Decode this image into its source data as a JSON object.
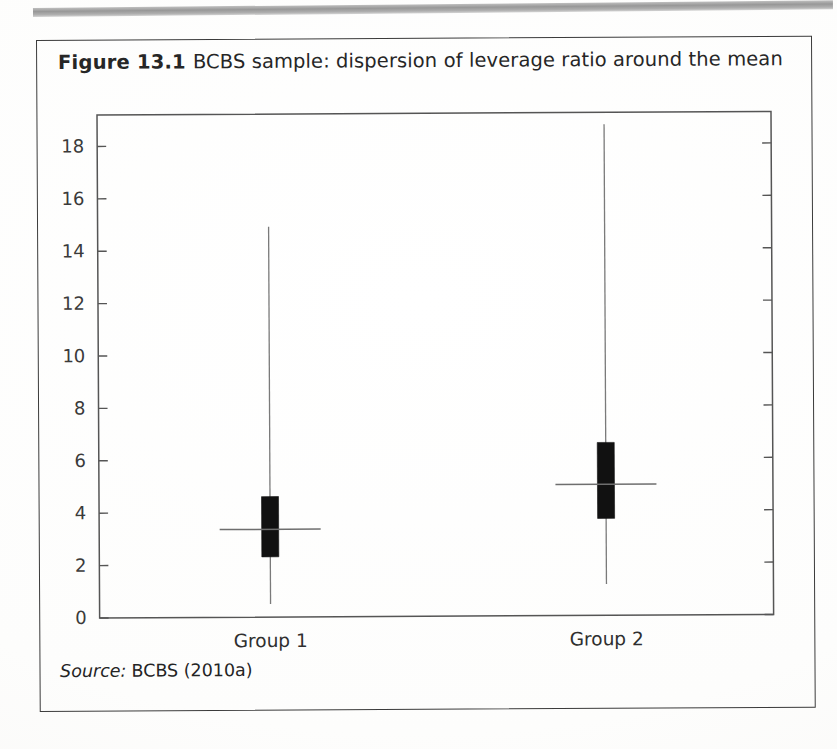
{
  "figure": {
    "caption_number": "Figure 13.1",
    "caption_text": "BCBS sample: dispersion of leverage ratio around the mean",
    "source_label": "Source:",
    "source_value": "BCBS (2010a)"
  },
  "colors": {
    "box_fill": "#111111",
    "whisker": "#7a7a7a",
    "mean_line": "#6e6e6e",
    "axis": "#555555",
    "frame": "#3b3b3b",
    "text": "#262626",
    "page": "#ffffff"
  },
  "chart_data": {
    "type": "box",
    "title": "BCBS sample: dispersion of leverage ratio around the mean",
    "xlabel": "",
    "ylabel": "",
    "ylim": [
      0,
      19.2
    ],
    "yticks": [
      0,
      2,
      4,
      6,
      8,
      10,
      12,
      14,
      16,
      18
    ],
    "ytick_labels": [
      "0",
      "2",
      "4",
      "6",
      "8",
      "10",
      "12",
      "14",
      "16",
      "18"
    ],
    "grid": false,
    "legend": null,
    "categories": [
      "Group 1",
      "Group 2"
    ],
    "series": [
      {
        "name": "Group 1",
        "whisker_low": 0.5,
        "box_low": 2.3,
        "mean": 3.35,
        "box_high": 4.6,
        "whisker_high": 14.9
      },
      {
        "name": "Group 2",
        "whisker_low": 1.2,
        "box_low": 3.7,
        "mean": 5.0,
        "box_high": 6.6,
        "whisker_high": 18.75
      }
    ]
  }
}
